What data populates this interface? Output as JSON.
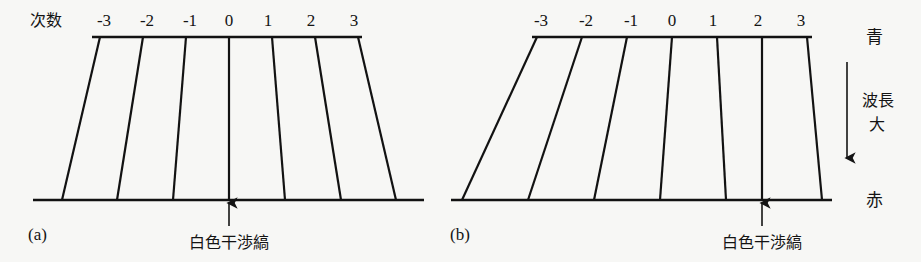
{
  "figure": {
    "background_color": "#f7f7f5",
    "ink_color": "#121212",
    "order_axis_title": "次数",
    "orders": [
      "-3",
      "-2",
      "-1",
      "0",
      "1",
      "2",
      "3"
    ],
    "spectrum": {
      "top_label": "青",
      "bottom_label": "赤",
      "arrow_label_line1": "波長",
      "arrow_label_line2": "大",
      "arrow_direction": "down"
    },
    "panels": [
      {
        "caption": "(a)",
        "fringe_annotation": "白色干渉縞",
        "white_fringe_order": "0",
        "geometry": {
          "top_line": {
            "x1": 92,
            "x2": 362,
            "y": 37
          },
          "bottom_line": {
            "x1": 33,
            "x2": 424,
            "y": 200
          },
          "top_x": [
            100,
            143,
            186,
            229,
            272,
            315,
            358
          ],
          "bottom_x": [
            62,
            117,
            173,
            229,
            285,
            341,
            396
          ],
          "label_y": 26,
          "label_x": [
            104,
            147,
            190,
            229,
            268,
            311,
            354
          ]
        },
        "caption_pos": {
          "x": 28,
          "y": 240
        },
        "annotation_pos": {
          "x": 229,
          "y": 248
        },
        "arrow": {
          "x": 229,
          "y_from": 226,
          "y_to": 203
        }
      },
      {
        "caption": "(b)",
        "fringe_annotation": "白色干渉縞",
        "white_fringe_order": "2",
        "geometry": {
          "top_line": {
            "x1": 532,
            "x2": 812,
            "y": 37
          },
          "bottom_line": {
            "x1": 451,
            "x2": 832,
            "y": 200
          },
          "top_x": [
            537,
            582,
            627,
            672,
            717,
            762,
            807
          ],
          "bottom_x": [
            462,
            528,
            594,
            660,
            726,
            762,
            822
          ],
          "label_y": 26,
          "label_x": [
            541,
            586,
            631,
            672,
            713,
            758,
            801
          ]
        },
        "caption_pos": {
          "x": 450,
          "y": 240
        },
        "annotation_pos": {
          "x": 762,
          "y": 248
        },
        "arrow": {
          "x": 762,
          "y_from": 226,
          "y_to": 203
        }
      }
    ],
    "side_panel": {
      "blue_pos": {
        "x": 866,
        "y": 42
      },
      "red_pos": {
        "x": 866,
        "y": 206
      },
      "arrow": {
        "x": 847,
        "y_from": 62,
        "y_to": 158
      },
      "text_pos": {
        "x": 862,
        "y": 108
      }
    }
  }
}
